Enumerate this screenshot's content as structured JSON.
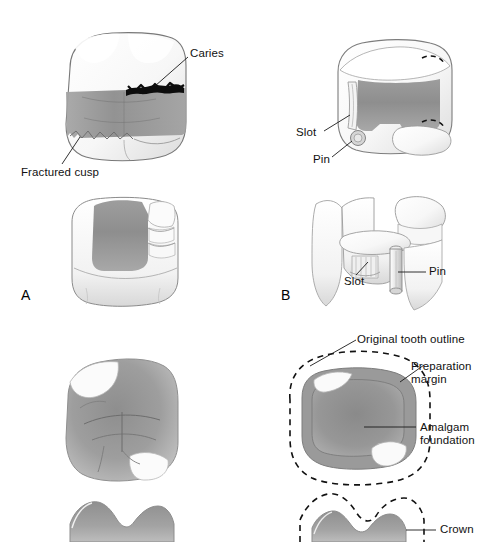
{
  "figure": {
    "background_color": "#ffffff",
    "width": 488,
    "height": 542
  },
  "palette": {
    "outline": "#6e6e6e",
    "enamel_light": "#fdfdfd",
    "enamel_shade": "#e3e3e3",
    "amalgam_dark": "#8c8c8c",
    "amalgam_mid": "#9a9a9a",
    "amalgam_light": "#b5b5b5",
    "caries_black": "#0d0d0d",
    "leader_line": "#1a1a1a",
    "text": "#111111"
  },
  "panels": [
    {
      "id": "A",
      "letter": "A",
      "caption": "A",
      "views": [
        "facial view of fractured, carious tooth",
        "proximal view of prepared tooth"
      ],
      "labels": [
        {
          "name": "caries",
          "text": "Caries"
        },
        {
          "name": "fractured-cusp",
          "text": "Fractured cusp"
        }
      ]
    },
    {
      "id": "B",
      "letter": "B",
      "caption": "B",
      "views": [
        "occlusal view of preparation with slot and pin",
        "proximal view of slot and pin"
      ],
      "labels": [
        {
          "name": "slot-top",
          "text": "Slot"
        },
        {
          "name": "pin-top",
          "text": "Pin"
        },
        {
          "name": "slot-bottom",
          "text": "Slot"
        },
        {
          "name": "pin-bottom",
          "text": "Pin"
        }
      ]
    },
    {
      "id": "C",
      "letter": "",
      "caption": "",
      "views": [
        "occlusal view of amalgam foundation",
        "facial cross-section of amalgam foundation"
      ],
      "labels": []
    },
    {
      "id": "D",
      "letter": "",
      "caption": "",
      "views": [
        "occlusal view with preparation margin",
        "facial cross-section with crown"
      ],
      "labels": [
        {
          "name": "original-tooth-outline",
          "text": "Original tooth outline"
        },
        {
          "name": "preparation-margin",
          "text": "Preparation margin"
        },
        {
          "name": "amalgam-foundation",
          "text": "Amalgam foundation"
        },
        {
          "name": "crown",
          "text": "Crown"
        }
      ]
    }
  ],
  "labels": {
    "caries": "Caries",
    "fractured_cusp": "Fractured cusp",
    "slot_top": "Slot",
    "pin_top": "Pin",
    "slot_bottom": "Slot",
    "pin_bottom": "Pin",
    "original_tooth_outline": "Original tooth outline",
    "preparation_margin_line1": "Preparation",
    "preparation_margin_line2": "margin",
    "amalgam_foundation_line1": "Amalgam",
    "amalgam_foundation_line2": "foundation",
    "crown": "Crown",
    "panel_a": "A",
    "panel_b": "B"
  }
}
